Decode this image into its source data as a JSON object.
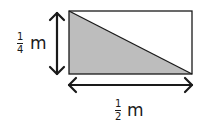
{
  "diagram": {
    "shape": "rectangle divided by diagonal into two right triangles",
    "shaded_region": "lower-left triangle",
    "colors": {
      "shade": "#bdbdbd",
      "stroke": "#1a1a1a",
      "background": "#ffffff"
    },
    "height_label": {
      "numerator": "1",
      "denominator": "4",
      "unit": "m"
    },
    "width_label": {
      "numerator": "1",
      "denominator": "2",
      "unit": "m"
    }
  }
}
